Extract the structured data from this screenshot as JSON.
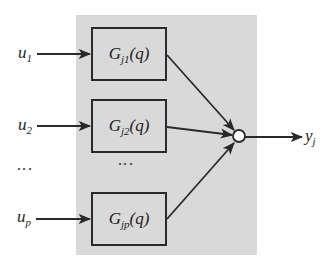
{
  "diagram": {
    "type": "block-diagram",
    "inputs": [
      {
        "base": "u",
        "sub": "1"
      },
      {
        "base": "u",
        "sub": "2"
      },
      {
        "base": "u",
        "sub": "p"
      }
    ],
    "input_ellipsis": "⋮",
    "blocks": [
      {
        "base": "G",
        "sub": "j1",
        "arg": "(q)"
      },
      {
        "base": "G",
        "sub": "j2",
        "arg": "(q)"
      },
      {
        "base": "G",
        "sub": "jp",
        "arg": "(q)"
      }
    ],
    "block_ellipsis": "⋮",
    "summing_junction": "sum-circle",
    "output": {
      "base": "y",
      "sub": "j"
    },
    "colors": {
      "panel": "#d9d9d9",
      "stroke": "#2a2a2a",
      "background": "#ffffff"
    }
  }
}
